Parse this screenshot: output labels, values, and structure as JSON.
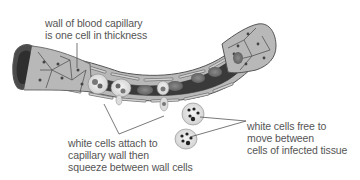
{
  "diagram": {
    "labels": {
      "wall": {
        "lines": [
          "wall of blood capillary",
          "is one cell in thickness"
        ]
      },
      "attach": {
        "lines": [
          "white cells attach to",
          "capillary wall then",
          "squeeze between wall cells"
        ]
      },
      "free": {
        "lines": [
          "white cells free to",
          "move between",
          "cells of infected tissue"
        ]
      }
    },
    "colors": {
      "wall_cell_fill": "#b8b8b8",
      "wall_cell_outline": "#555555",
      "lumen": "#3a3a3a",
      "red_cell": "#6e6e6e",
      "white_cell": "#e6e6e6",
      "leader_line": "#555555",
      "text": "#555555"
    }
  }
}
